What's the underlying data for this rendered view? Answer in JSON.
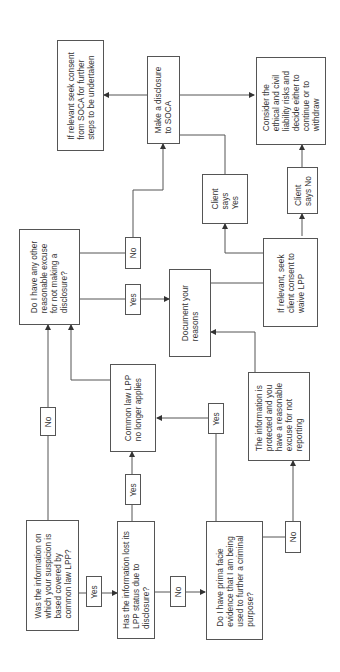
{
  "nodes": {
    "q1": "Was the information on\nwhich your suspicion is\nbased covered by\ncommon law LPP?",
    "q2": "Has the information lost its\nLPP status due to\ndisclosure?",
    "q3": "Do I have prima facie\nevidence that I am being\nused to further a criminal\npurpose?",
    "q4": "Do I have any other\nreasonable excuse\nfor not making a\ndisclosure?",
    "lpp_gone": "Common law LPP\nno longer applies",
    "protected": "The information is\nprotected and you\nhave a reasonable\nexcuse for not\nreporting",
    "document": "Document your\nreasons",
    "seek_client": "If relevant, seek\nclient consent to\nwaive LPP",
    "client_yes": "Client\nsays\nYes",
    "client_no": "Client\nsays No",
    "disclose": "Make a disclosure\nto SOCA",
    "soca_consent": "If relevant seek consent\nfrom SOCA for further\nsteps to be undertaken",
    "consider": "Consider the\nethical and civil\nliability risks and\ndecide either to\ncontinue or to\nwithdraw"
  },
  "labels": {
    "q1_yes": "Yes",
    "q1_no": "No",
    "q2_yes": "Yes",
    "q2_no": "No",
    "q3_yes": "Yes",
    "q3_no": "No",
    "q4_yes": "Yes",
    "q4_no": "No"
  },
  "colors": {
    "line": "#555555",
    "text": "#333333"
  }
}
